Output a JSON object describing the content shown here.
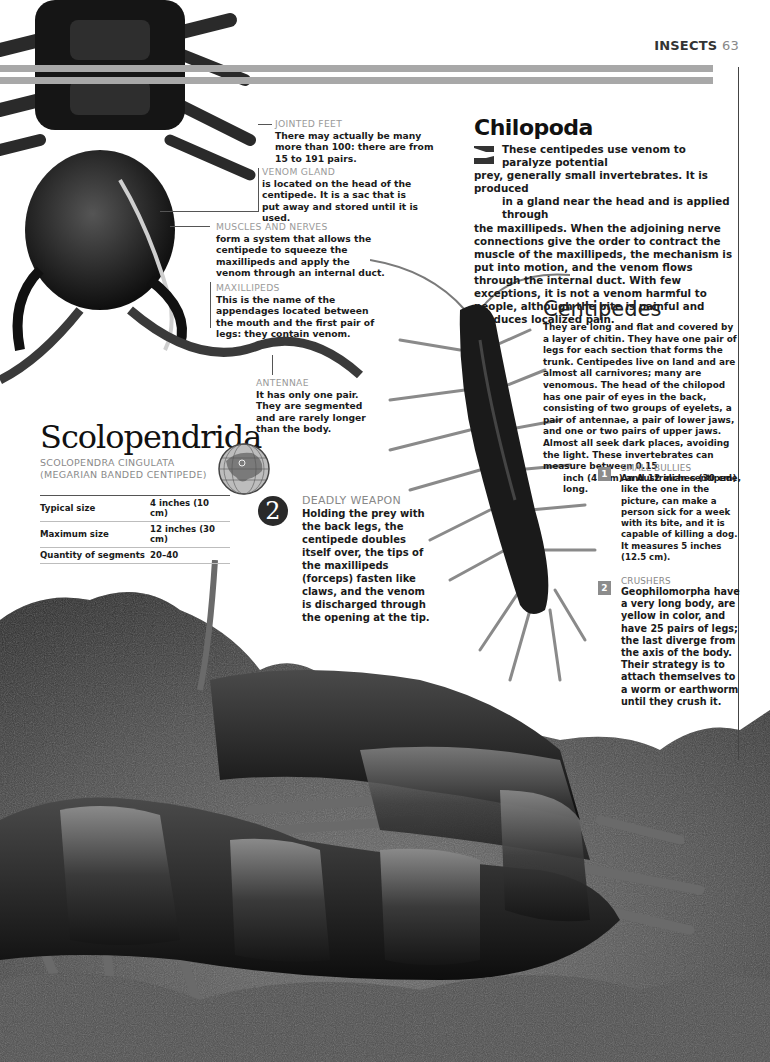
{
  "header": {
    "section": "INSECTS",
    "page_number": "63"
  },
  "callouts": [
    {
      "label": "JOINTED FEET",
      "text": "There may actually be many more than 100: there are from 15 to 191 pairs."
    },
    {
      "label": "VENOM GLAND",
      "text": "is located on the head of the centipede. It is a sac that is put away and stored until it is used."
    },
    {
      "label": "MUSCLES AND NERVES",
      "text": "form a system that allows the centipede to squeeze the maxillipeds and apply the venom through an internal duct."
    },
    {
      "label": "MAXILLIPEDS",
      "text": "This is the name of the appendages located between the mouth and the first pair of legs: they contain venom."
    },
    {
      "label": "ANTENNAE",
      "text": "It has only one pair. They are segmented and are rarely longer than the body."
    }
  ],
  "chilopoda": {
    "title": "Chilopoda",
    "icon": "arrow-flag-icon",
    "line1": "These centipedes use venom to paralyze potential",
    "line2": "prey, generally small invertebrates. It is produced",
    "line3": "in a gland near the head and is applied through",
    "rest": "the maxillipeds. When the adjoining nerve connections give the order to contract the muscle of the maxillipeds, the mechanism is put into motion, and the venom flows through the internal duct. With few exceptions, it is not a venom harmful to people, although the bite is painful and produces localized pain."
  },
  "centipedes": {
    "title": "Centipedes",
    "body": "They are long and flat and covered by a layer of chitin. They have one pair of legs for each section that forms the trunk. Centipedes live on land and are almost all carnivores; many are venomous. The head of the chilopod has one pair of eyes in the back, consisting of two groups of eyelets, a pair of antennae, a pair of lower jaws, and one or two pairs of upper jaws. Almost all seek dark places, avoiding the light. These invertebrates can measure between 0.15",
    "last_line": "inch (4 mm) and 12 inches (30 cm) long."
  },
  "species": {
    "title": "Scolopendrida",
    "scientific_name": "SCOLOPENDRA CINGULATA",
    "common_name": "(MEGARIAN BANDED CENTIPEDE)",
    "globe_icon": "globe-asia-icon",
    "facts": [
      {
        "key": "Typical size",
        "value": "4 inches (10 cm)"
      },
      {
        "key": "Maximum size",
        "value": "12 inches (30 cm)"
      },
      {
        "key": "Quantity of segments",
        "value": "20–40"
      }
    ]
  },
  "deadly_weapon": {
    "number": "2",
    "label": "DEADLY WEAPON",
    "text": "Holding the prey with the back legs, the centipede doubles itself over, the tips of the maxillipeds (forceps) fasten like claws, and the venom is discharged through the opening at the tip."
  },
  "side_notes": [
    {
      "number": "1",
      "label": "SMALL BULLIES",
      "text": "An Australian centipede, like the one in the picture, can make a person sick for a week with its bite, and it is capable of killing a dog. It measures 5 inches (12.5 cm)."
    },
    {
      "number": "2",
      "label": "CRUSHERS",
      "text": "Geophilomorpha have a very long body, are yellow in color, and have 25 pairs of legs; the last diverge from the axis of the body. Their strategy is to attach themselves to a worm or earthworm until they crush it."
    }
  ],
  "colors": {
    "stripe": "#a8a8a8",
    "label_gray": "#9a9a9a",
    "number_badge": "#8c8c8c",
    "number_circle": "#2a2a2a"
  }
}
